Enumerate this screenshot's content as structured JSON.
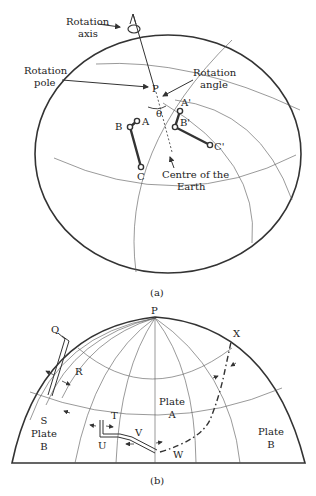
{
  "figure_a": {
    "caption": "(a)",
    "labels": {
      "rotation_axis_line1": "Rotation",
      "rotation_axis_line2": "axis",
      "rotation_pole_line1": "Rotation",
      "rotation_pole_line2": "pole",
      "rotation_angle_line1": "Rotation",
      "rotation_angle_line2": "angle",
      "centre_line1": "Centre of the",
      "centre_line2": "Earth",
      "pole": "P",
      "theta": "θ",
      "points": [
        "A",
        "B",
        "C",
        "A'",
        "B'",
        "C'"
      ]
    }
  },
  "figure_b": {
    "caption": "(b)",
    "labels": {
      "pole": "P",
      "points": [
        "Q",
        "R",
        "T",
        "U",
        "V",
        "W",
        "X"
      ],
      "plate_s_line1": "S",
      "plate_s_line2": "Plate",
      "plate_s_line3": "B",
      "plate_a_line1": "Plate",
      "plate_a_line2": "A",
      "plate_b_line1": "Plate",
      "plate_b_line2": "B"
    }
  }
}
